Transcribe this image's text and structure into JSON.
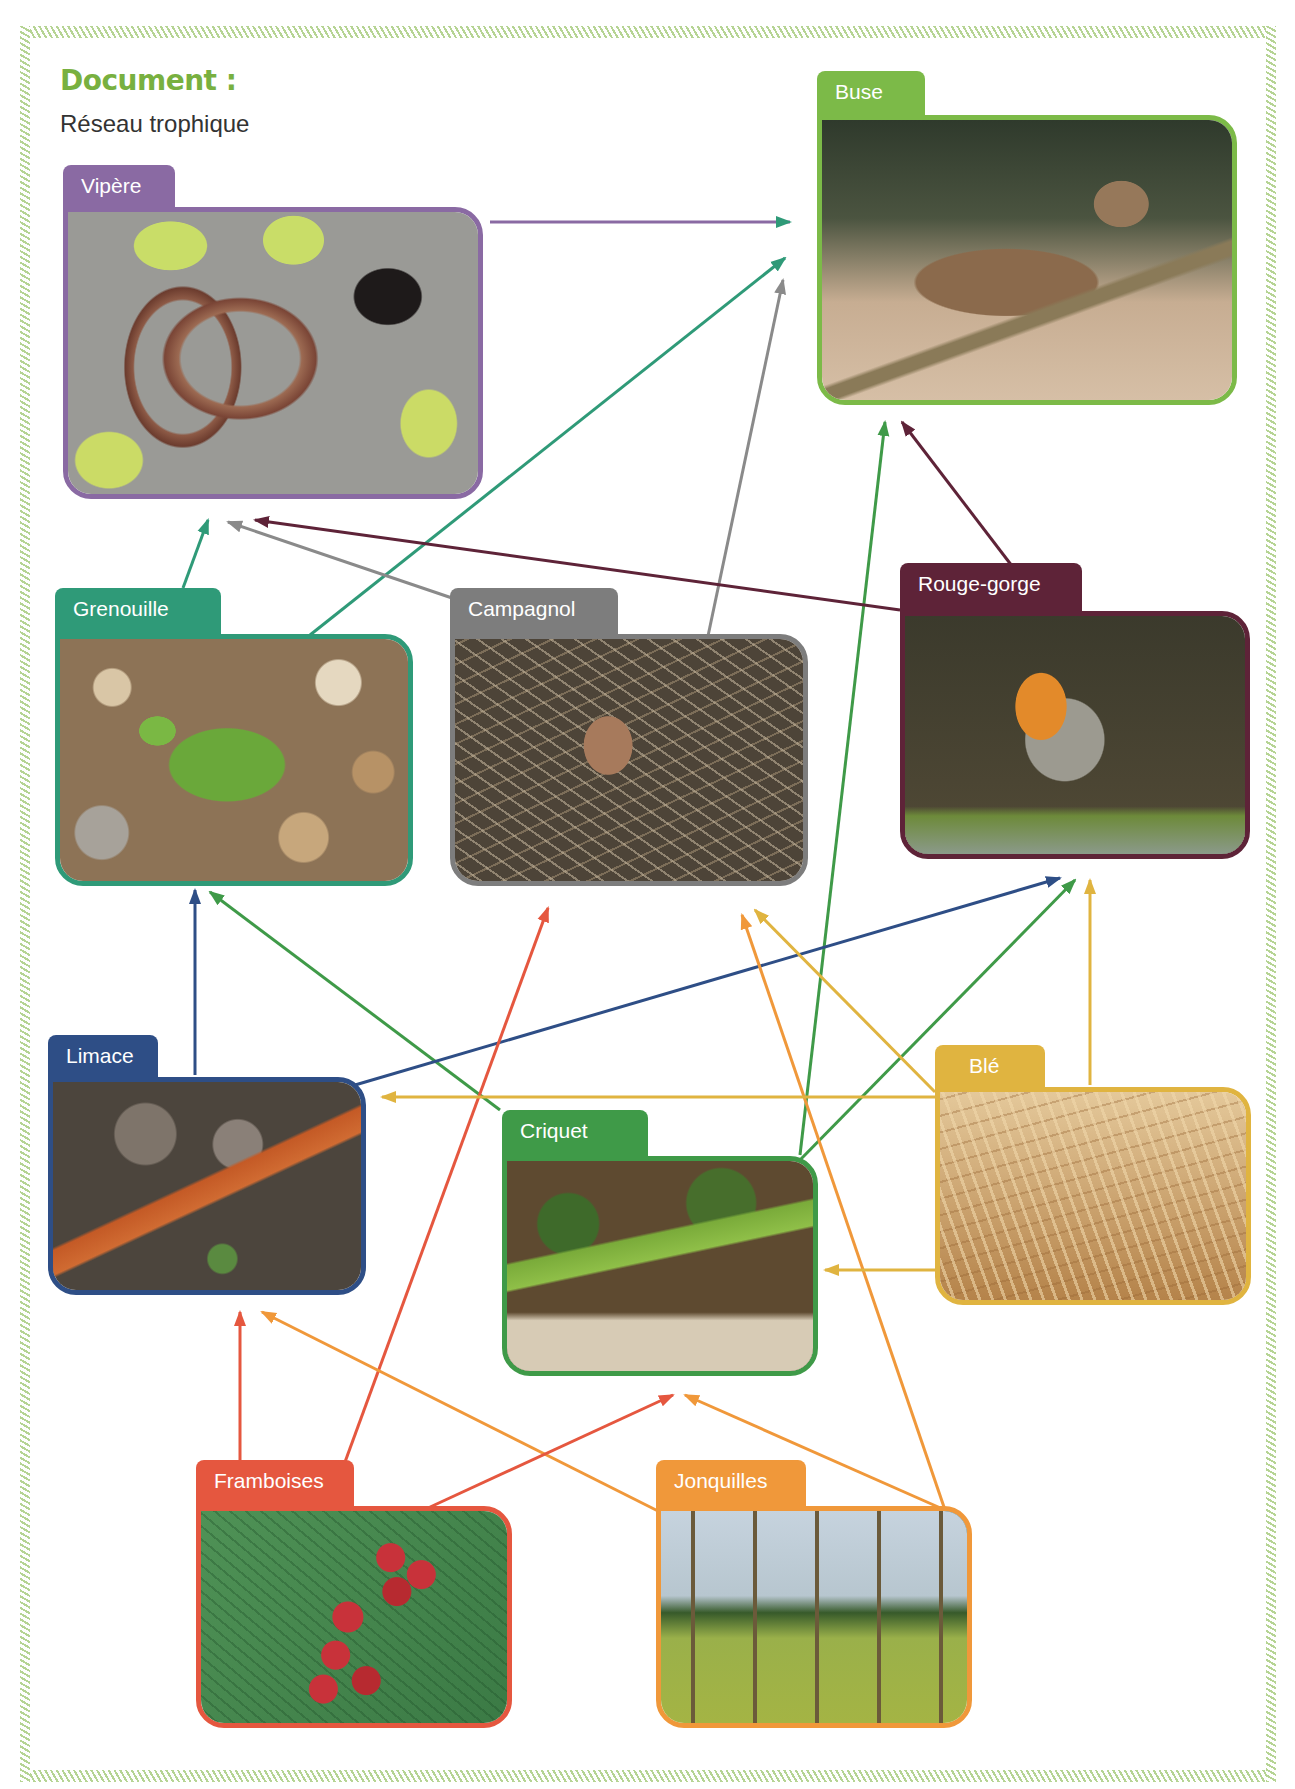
{
  "document": {
    "title": "Document :",
    "subtitle": "Réseau trophique"
  },
  "colors": {
    "frame_hatch": "#b6d494",
    "title_green": "#78b040"
  },
  "organisms": [
    {
      "id": "vipere",
      "label": "Vipère",
      "color": "#8a6aa3",
      "photo": "viper-on-lichen-rock"
    },
    {
      "id": "buse",
      "label": "Buse",
      "color": "#7cba48",
      "photo": "buzzard-on-branch"
    },
    {
      "id": "grenouille",
      "label": "Grenouille",
      "color": "#2f9a78",
      "photo": "frog-on-pebbles"
    },
    {
      "id": "campagnol",
      "label": "Campagnol",
      "color": "#7d7d7d",
      "photo": "vole-in-dry-grass"
    },
    {
      "id": "rouge_gorge",
      "label": "Rouge-gorge",
      "color": "#5e2338",
      "photo": "robin-on-mossy-rock"
    },
    {
      "id": "limace",
      "label": "Limace",
      "color": "#2e4e86",
      "photo": "slug-on-soil"
    },
    {
      "id": "criquet",
      "label": "Criquet",
      "color": "#3f9a48",
      "photo": "grasshopper-on-leaves"
    },
    {
      "id": "ble",
      "label": "Blé",
      "color": "#e0b440",
      "photo": "wheat-field"
    },
    {
      "id": "framboises",
      "label": "Framboises",
      "color": "#e5573f",
      "photo": "raspberries-and-leaves"
    },
    {
      "id": "jonquilles",
      "label": "Jonquilles",
      "color": "#f0983a",
      "photo": "daffodil-woodland"
    }
  ],
  "relations": [
    {
      "from": "Vipère",
      "to": "Buse",
      "color": "#8a6aa3"
    },
    {
      "from": "Grenouille",
      "to": "Buse",
      "color": "#2f9a78"
    },
    {
      "from": "Campagnol",
      "to": "Buse",
      "color": "#8a8a8a"
    },
    {
      "from": "Criquet",
      "to": "Buse",
      "color": "#3f9a48"
    },
    {
      "from": "Rouge-gorge",
      "to": "Buse",
      "color": "#5e2338"
    },
    {
      "from": "Grenouille",
      "to": "Vipère",
      "color": "#2f9a78"
    },
    {
      "from": "Campagnol",
      "to": "Vipère",
      "color": "#8a8a8a"
    },
    {
      "from": "Rouge-gorge",
      "to": "Vipère",
      "color": "#5e2338"
    },
    {
      "from": "Limace",
      "to": "Grenouille",
      "color": "#2e4e86"
    },
    {
      "from": "Criquet",
      "to": "Grenouille",
      "color": "#3f9a48"
    },
    {
      "from": "Limace",
      "to": "Rouge-gorge",
      "color": "#2e4e86"
    },
    {
      "from": "Criquet",
      "to": "Rouge-gorge",
      "color": "#3f9a48"
    },
    {
      "from": "Blé",
      "to": "Rouge-gorge",
      "color": "#e0b440"
    },
    {
      "from": "Framboises",
      "to": "Campagnol",
      "color": "#e5573f"
    },
    {
      "from": "Jonquilles",
      "to": "Campagnol",
      "color": "#f0983a"
    },
    {
      "from": "Blé",
      "to": "Campagnol",
      "color": "#e0b440"
    },
    {
      "from": "Blé",
      "to": "Limace",
      "color": "#e0b440"
    },
    {
      "from": "Blé",
      "to": "Criquet",
      "color": "#e0b440"
    },
    {
      "from": "Framboises",
      "to": "Limace",
      "color": "#e5573f"
    },
    {
      "from": "Jonquilles",
      "to": "Limace",
      "color": "#f0983a"
    },
    {
      "from": "Framboises",
      "to": "Criquet",
      "color": "#e5573f"
    },
    {
      "from": "Jonquilles",
      "to": "Criquet",
      "color": "#f0983a"
    }
  ]
}
